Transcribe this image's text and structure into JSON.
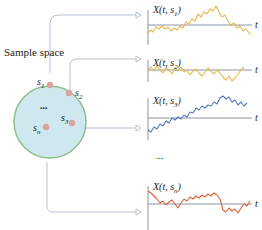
{
  "title": "Sample space",
  "sample_points": [
    {
      "id": "s1",
      "label": "s",
      "sub": "1"
    },
    {
      "id": "s2",
      "label": "s",
      "sub": "2"
    },
    {
      "id": "s3",
      "label": "s",
      "sub": "3"
    },
    {
      "id": "sn",
      "label": "s",
      "sub": "n"
    }
  ],
  "ellipsis": "...",
  "ellipsis_between_plots": "...",
  "plots": [
    {
      "label_prefix": "X(t, s",
      "sub": "1",
      "label_suffix": ")",
      "axis_label": "t",
      "color": "#e8b84a"
    },
    {
      "label_prefix": "X(t, s",
      "sub": "2",
      "label_suffix": ")",
      "axis_label": "t",
      "color": "#e8b84a"
    },
    {
      "label_prefix": "X(t, s",
      "sub": "3",
      "label_suffix": ")",
      "axis_label": "t",
      "color": "#5a78b8"
    },
    {
      "label_prefix": "X(t, s",
      "sub": "n",
      "label_suffix": ")",
      "axis_label": "t",
      "color": "#d9653b"
    }
  ],
  "colors": {
    "circle_fill": "#cfe7ee",
    "circle_stroke": "#8cc08c",
    "dot": "#d9a3a0",
    "connector": "#b8bfd0",
    "axis": "#8a94a8"
  }
}
